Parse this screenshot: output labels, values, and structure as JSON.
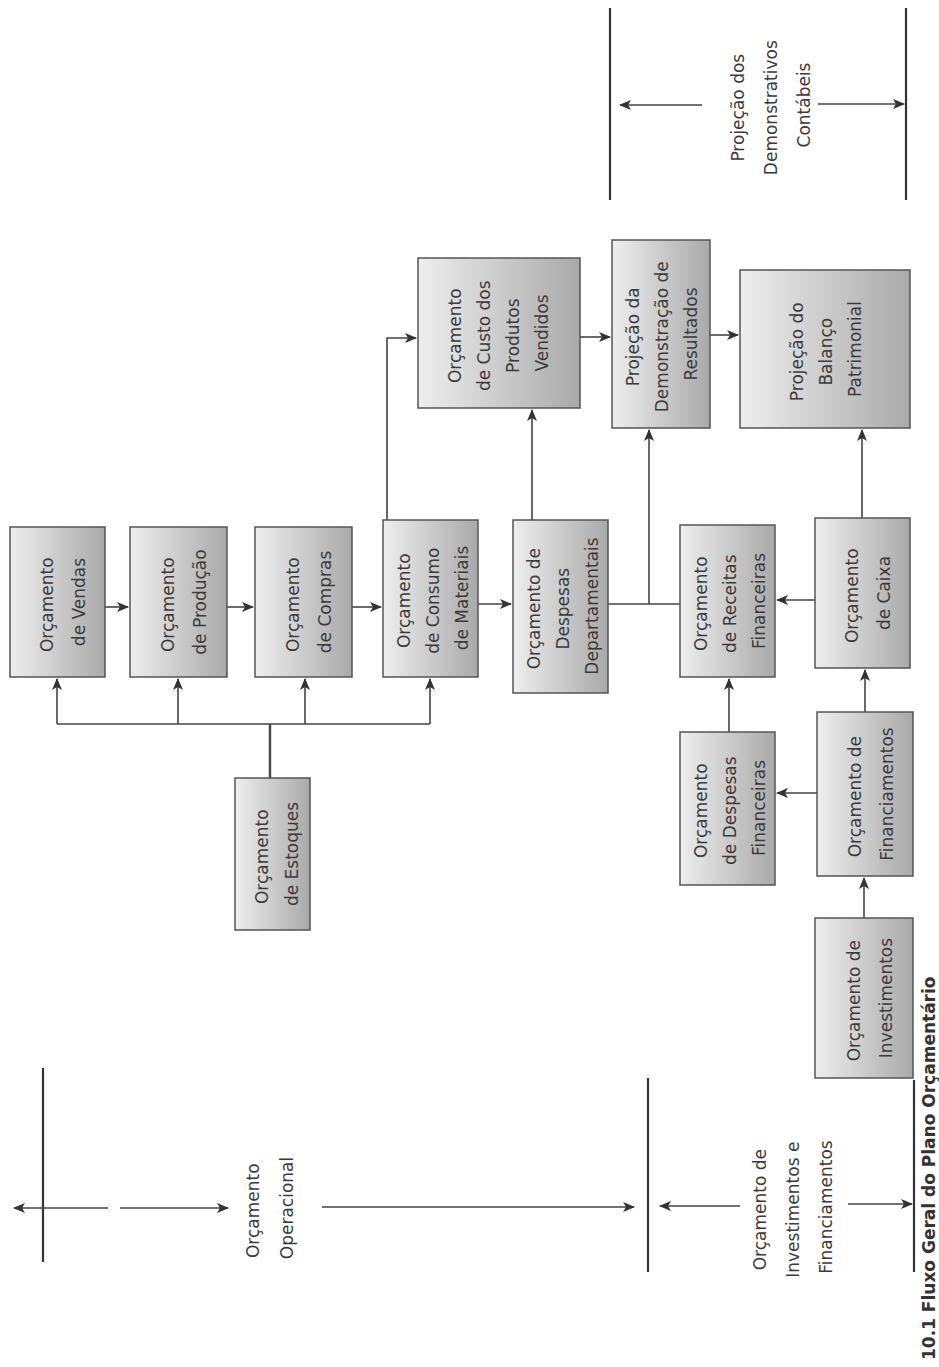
{
  "diagram": {
    "orientation": "rotated-90-ccw",
    "caption": "10.1 Fluxo Geral do Plano Orçamentário",
    "colors": {
      "box_light": "#f2f2f2",
      "box_dark": "#a8a8a8",
      "line": "#444444",
      "text": "#3a3a3a"
    },
    "sections": [
      {
        "id": "operacional",
        "lines": [
          "Orçamento",
          "Operacional"
        ]
      },
      {
        "id": "investimentos_financiamentos",
        "lines": [
          "Orçamento de",
          "Investimentos e",
          "Financiamentos"
        ]
      },
      {
        "id": "demonstrativos",
        "lines": [
          "Projeção dos",
          "Demonstrativos",
          "Contábeis"
        ]
      }
    ],
    "boxes": [
      {
        "id": "vendas",
        "lines": [
          "Orçamento",
          "de Vendas"
        ]
      },
      {
        "id": "producao",
        "lines": [
          "Orçamento",
          "de Produção"
        ]
      },
      {
        "id": "compras",
        "lines": [
          "Orçamento",
          "de Compras"
        ]
      },
      {
        "id": "consumo",
        "lines": [
          "Orçamento",
          "de Consumo",
          "de Materiais"
        ]
      },
      {
        "id": "despesas_dep",
        "lines": [
          "Orçamento de",
          "Despesas",
          "Departamentais"
        ]
      },
      {
        "id": "cpv",
        "lines": [
          "Orçamento",
          "de Custo dos",
          "Produtos",
          "Vendidos"
        ]
      },
      {
        "id": "dre",
        "lines": [
          "Projeção da",
          "Demonstração de",
          "Resultados"
        ]
      },
      {
        "id": "balanco",
        "lines": [
          "Projeção do",
          "Balanço",
          "Patrimonial"
        ]
      },
      {
        "id": "receitas_fin",
        "lines": [
          "Orçamento",
          "de Receitas",
          "Financeiras"
        ]
      },
      {
        "id": "caixa",
        "lines": [
          "Orçamento",
          "de Caixa"
        ]
      },
      {
        "id": "estoques",
        "lines": [
          "Orçamento",
          "de Estoques"
        ]
      },
      {
        "id": "despesas_fin",
        "lines": [
          "Orçamento",
          "de Despesas",
          "Financeiras"
        ]
      },
      {
        "id": "financiamentos",
        "lines": [
          "Orçamento de",
          "Financiamentos"
        ]
      },
      {
        "id": "investimentos",
        "lines": [
          "Orçamento de",
          "Investimentos"
        ]
      }
    ],
    "edges": [
      {
        "from": "vendas",
        "to": "producao"
      },
      {
        "from": "producao",
        "to": "compras"
      },
      {
        "from": "compras",
        "to": "consumo"
      },
      {
        "from": "consumo",
        "to": "despesas_dep"
      },
      {
        "from": "consumo",
        "to": "cpv"
      },
      {
        "from": "despesas_dep",
        "to": "cpv"
      },
      {
        "from": "despesas_dep",
        "to": "dre"
      },
      {
        "from": "receitas_fin",
        "to": "dre"
      },
      {
        "from": "cpv",
        "to": "dre"
      },
      {
        "from": "dre",
        "to": "balanco"
      },
      {
        "from": "caixa",
        "to": "balanco"
      },
      {
        "from": "caixa",
        "to": "receitas_fin"
      },
      {
        "from": "estoques",
        "to": "vendas"
      },
      {
        "from": "estoques",
        "to": "producao"
      },
      {
        "from": "estoques",
        "to": "compras"
      },
      {
        "from": "estoques",
        "to": "consumo"
      },
      {
        "from": "despesas_fin",
        "to": "receitas_fin"
      },
      {
        "from": "financiamentos",
        "to": "despesas_fin"
      },
      {
        "from": "financiamentos",
        "to": "caixa"
      },
      {
        "from": "investimentos",
        "to": "financiamentos"
      }
    ]
  }
}
